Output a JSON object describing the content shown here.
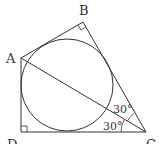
{
  "diagram": {
    "points": {
      "A": {
        "label": "A",
        "x": 21,
        "y": 58
      },
      "B": {
        "label": "B",
        "x": 83,
        "y": 22
      },
      "C": {
        "label": "C",
        "x": 146,
        "y": 132
      },
      "D": {
        "label": "D",
        "x": 21,
        "y": 132
      }
    },
    "circle": {
      "cx": 67,
      "cy": 85,
      "r": 46
    },
    "angles": {
      "angle_BCA": "30°",
      "angle_ACD": "30°"
    },
    "right_angles": [
      "B",
      "D"
    ],
    "colors": {
      "stroke": "#333333",
      "background": "#ffffff"
    }
  }
}
